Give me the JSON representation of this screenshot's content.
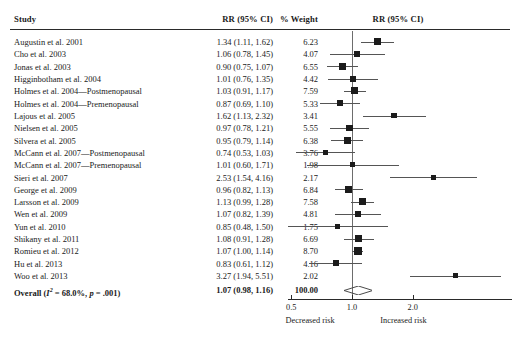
{
  "figure": {
    "type": "forest-plot",
    "headers": {
      "study": "Study",
      "effect": "RR (95% CI)",
      "weight": "% Weight",
      "plot": "RR (95% CI)"
    },
    "axis": {
      "scale": "log",
      "ticks": [
        0.5,
        1.0,
        2.0
      ],
      "tick_labels": [
        "0.5",
        "1.0",
        "2.0"
      ],
      "null_value": 1.0,
      "left_label": "Decreased risk",
      "right_label": "Increased risk",
      "xmin": 0.45,
      "xmax": 5.6
    },
    "overall": {
      "label": "Overall (I² = 68.0%, p = .001)",
      "label_prefix": "Overall (",
      "label_i": "I",
      "label_sup": "2",
      "label_mid": " = 68.0%, ",
      "label_p": "p",
      "label_suffix": " = .001)",
      "effect_text": "1.07 (0.98, 1.16)",
      "weight_text": "100.00",
      "rr": 1.07,
      "lcl": 0.98,
      "ucl": 1.16,
      "heterogeneity_i2": "68.0%",
      "p_value": ".001"
    },
    "colors": {
      "marker": "#1b1b1b",
      "ci_line": "#555555",
      "null_line": "#6d6d6d",
      "axis": "#2a2a2a",
      "text": "#1a1a1a",
      "background": "#ffffff"
    }
  },
  "chart_data": {
    "type": "forest",
    "title": "",
    "xlabel": "RR (95% CI)",
    "ylabel": "Study",
    "xscale": "log",
    "xlim": [
      0.45,
      5.6
    ],
    "xticks": [
      0.5,
      1.0,
      2.0
    ],
    "null_line": 1.0,
    "grid": false,
    "legend": false,
    "columns": [
      "Study",
      "RR (95% CI)",
      "% Weight"
    ],
    "rows": [
      {
        "study": "Augustin et al. 2001",
        "effect_text": "1.34 (1.11, 1.62)",
        "weight_text": "6.23",
        "rr": 1.34,
        "lcl": 1.11,
        "ucl": 1.62,
        "weight": 6.23
      },
      {
        "study": "Cho et al. 2003",
        "effect_text": "1.06 (0.78, 1.45)",
        "weight_text": "4.07",
        "rr": 1.06,
        "lcl": 0.78,
        "ucl": 1.45,
        "weight": 4.07
      },
      {
        "study": "Jonas et al. 2003",
        "effect_text": "0.90 (0.75, 1.07)",
        "weight_text": "6.55",
        "rr": 0.9,
        "lcl": 0.75,
        "ucl": 1.07,
        "weight": 6.55
      },
      {
        "study": "Higginbotham et al. 2004",
        "effect_text": "1.01 (0.76, 1.35)",
        "weight_text": "4.42",
        "rr": 1.01,
        "lcl": 0.76,
        "ucl": 1.35,
        "weight": 4.42
      },
      {
        "study": "Holmes et al. 2004—Postmenopausal",
        "effect_text": "1.03 (0.91, 1.17)",
        "weight_text": "7.59",
        "rr": 1.03,
        "lcl": 0.91,
        "ucl": 1.17,
        "weight": 7.59
      },
      {
        "study": "Holmes et al. 2004—Premenopausal",
        "effect_text": "0.87 (0.69, 1.10)",
        "weight_text": "5.33",
        "rr": 0.87,
        "lcl": 0.69,
        "ucl": 1.1,
        "weight": 5.33
      },
      {
        "study": "Lajous et al. 2005",
        "effect_text": "1.62 (1.13, 2.32)",
        "weight_text": "3.41",
        "rr": 1.62,
        "lcl": 1.13,
        "ucl": 2.32,
        "weight": 3.41
      },
      {
        "study": "Nielsen et al. 2005",
        "effect_text": "0.97 (0.78, 1.21)",
        "weight_text": "5.55",
        "rr": 0.97,
        "lcl": 0.78,
        "ucl": 1.21,
        "weight": 5.55
      },
      {
        "study": "Silvera et al. 2005",
        "effect_text": "0.95 (0.79, 1.14)",
        "weight_text": "6.38",
        "rr": 0.95,
        "lcl": 0.79,
        "ucl": 1.14,
        "weight": 6.38
      },
      {
        "study": "McCann et al. 2007—Postmenopausal",
        "effect_text": "0.74 (0.53, 1.03)",
        "weight_text": "3.76",
        "rr": 0.74,
        "lcl": 0.53,
        "ucl": 1.03,
        "weight": 3.76
      },
      {
        "study": "McCann et al. 2007—Premenopausal",
        "effect_text": "1.01 (0.60, 1.71)",
        "weight_text": "1.98",
        "rr": 1.01,
        "lcl": 0.6,
        "ucl": 1.71,
        "weight": 1.98
      },
      {
        "study": "Sieri et al. 2007",
        "effect_text": "2.53 (1.54, 4.16)",
        "weight_text": "2.17",
        "rr": 2.53,
        "lcl": 1.54,
        "ucl": 4.16,
        "weight": 2.17
      },
      {
        "study": "George et al. 2009",
        "effect_text": "0.96 (0.82, 1.13)",
        "weight_text": "6.84",
        "rr": 0.96,
        "lcl": 0.82,
        "ucl": 1.13,
        "weight": 6.84
      },
      {
        "study": "Larsson et al. 2009",
        "effect_text": "1.13 (0.99, 1.28)",
        "weight_text": "7.58",
        "rr": 1.13,
        "lcl": 0.99,
        "ucl": 1.28,
        "weight": 7.58
      },
      {
        "study": "Wen et al. 2009",
        "effect_text": "1.07 (0.82, 1.39)",
        "weight_text": "4.81",
        "rr": 1.07,
        "lcl": 0.82,
        "ucl": 1.39,
        "weight": 4.81
      },
      {
        "study": "Yun et al. 2010",
        "effect_text": "0.85 (0.48, 1.50)",
        "weight_text": "1.75",
        "rr": 0.85,
        "lcl": 0.48,
        "ucl": 1.5,
        "weight": 1.75
      },
      {
        "study": "Shikany et al. 2011",
        "effect_text": "1.08 (0.91, 1.28)",
        "weight_text": "6.69",
        "rr": 1.08,
        "lcl": 0.91,
        "ucl": 1.28,
        "weight": 6.69
      },
      {
        "study": "Romieu et al. 2012",
        "effect_text": "1.07 (1.00, 1.14)",
        "weight_text": "8.70",
        "rr": 1.07,
        "lcl": 1.0,
        "ucl": 1.14,
        "weight": 8.7
      },
      {
        "study": "Hu et al. 2013",
        "effect_text": "0.83 (0.61, 1.12)",
        "weight_text": "4.16",
        "rr": 0.83,
        "lcl": 0.61,
        "ucl": 1.12,
        "weight": 4.16
      },
      {
        "study": "Woo et al. 2013",
        "effect_text": "3.27 (1.94, 5.51)",
        "weight_text": "2.02",
        "rr": 3.27,
        "lcl": 1.94,
        "ucl": 5.51,
        "weight": 2.02
      }
    ],
    "summary": {
      "label": "Overall (I2 = 68.0%, p = .001)",
      "effect_text": "1.07 (0.98, 1.16)",
      "weight_text": "100.00",
      "rr": 1.07,
      "lcl": 0.98,
      "ucl": 1.16
    }
  }
}
